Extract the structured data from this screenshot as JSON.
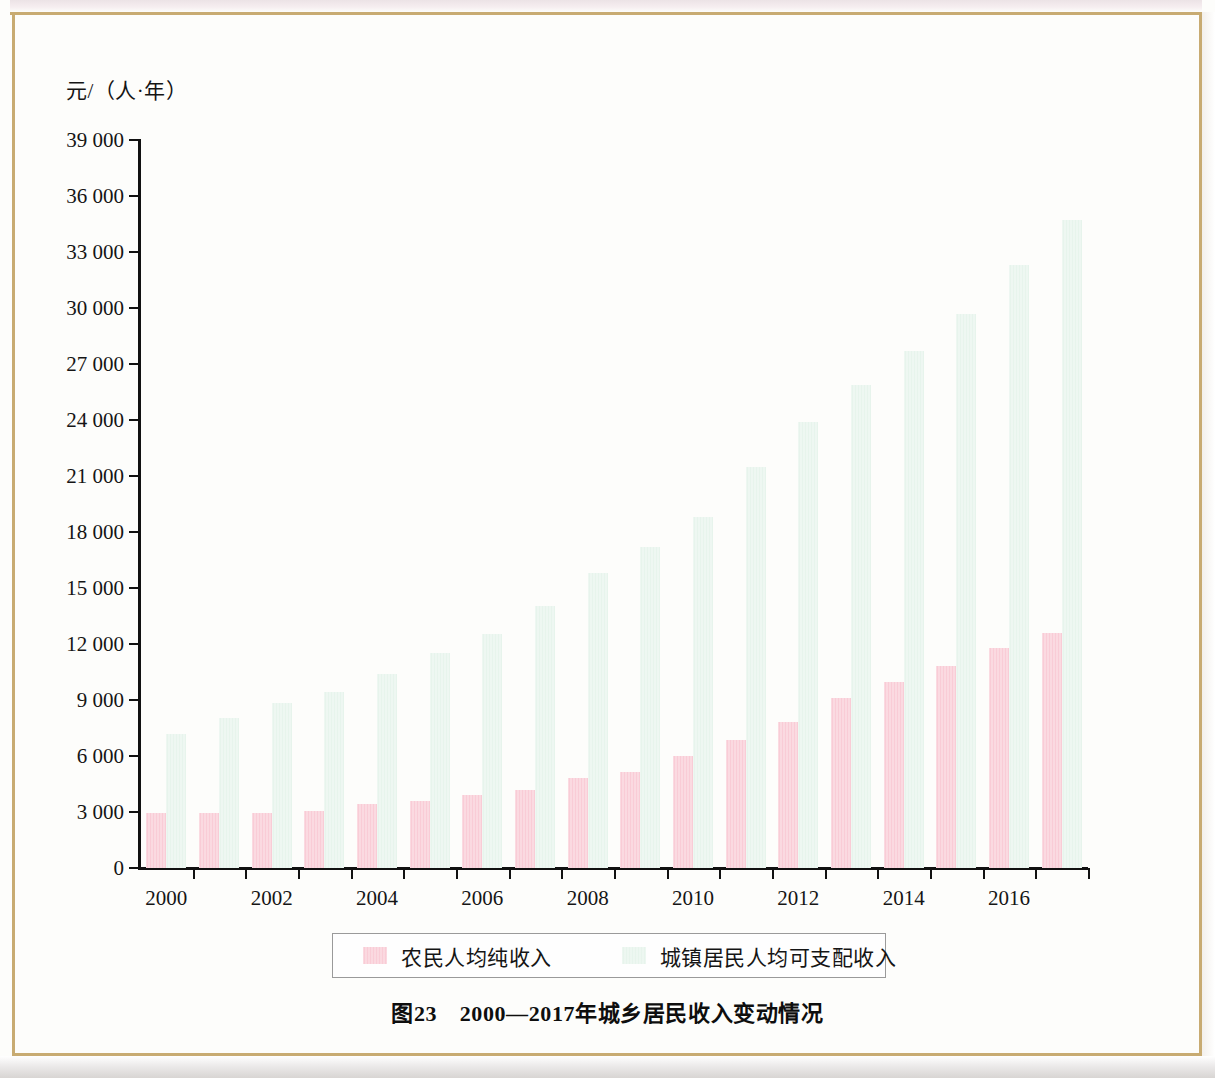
{
  "figure": {
    "caption": "图23　2000—2017年城乡居民收入变动情况",
    "y_axis_unit": "元/（人·年）"
  },
  "legend": {
    "rural_label": "农民人均纯收入",
    "urban_label": "城镇居民人均可支配收入"
  },
  "colors": {
    "rural": "#f9ccd6",
    "urban": "#e7f4ec",
    "axis": "#111111",
    "frame": "#c8ab72",
    "page_background": "#fdfdfb"
  },
  "chart_data": {
    "type": "bar",
    "title": "图23　2000—2017年城乡居民收入变动情况",
    "xlabel": "",
    "ylabel": "元/（人·年）",
    "ylim": [
      0,
      39000
    ],
    "ytick_step": 3000,
    "ytick_labels": [
      "0",
      "3 000",
      "6 000",
      "9 000",
      "12 000",
      "15 000",
      "18 000",
      "21 000",
      "24 000",
      "27 000",
      "30 000",
      "33 000",
      "36 000",
      "39 000"
    ],
    "grid": false,
    "legend_position": "bottom",
    "categories": [
      "2000",
      "2001",
      "2002",
      "2003",
      "2004",
      "2005",
      "2006",
      "2007",
      "2008",
      "2009",
      "2010",
      "2011",
      "2012",
      "2013",
      "2014",
      "2015",
      "2016",
      "2017"
    ],
    "xtick_labels_shown": [
      "2000",
      "2002",
      "2004",
      "2006",
      "2008",
      "2010",
      "2012",
      "2014",
      "2016"
    ],
    "series": [
      {
        "name": "农民人均纯收入",
        "color": "#f9ccd6",
        "values": [
          2950,
          2960,
          2940,
          3080,
          3450,
          3610,
          3900,
          4200,
          4800,
          5150,
          5990,
          6880,
          7800,
          9100,
          9950,
          10800,
          11800,
          12600
        ]
      },
      {
        "name": "城镇居民人均可支配收入",
        "color": "#e7f4ec",
        "values": [
          7200,
          8050,
          8850,
          9450,
          10400,
          11500,
          12550,
          14050,
          15800,
          17200,
          18800,
          21500,
          23900,
          25850,
          27700,
          29700,
          32300,
          34700
        ]
      }
    ]
  }
}
